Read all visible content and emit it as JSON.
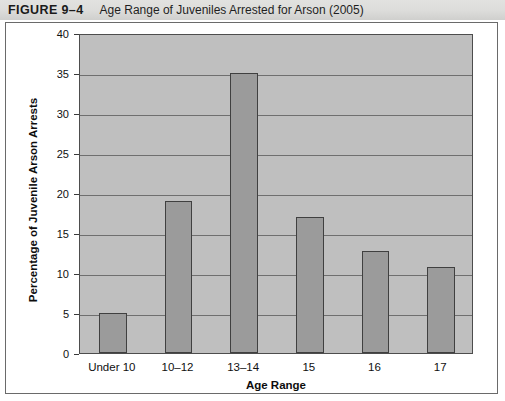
{
  "header": {
    "figure_label": "FIGURE 9–4",
    "figure_title": "Age Range of Juveniles Arrested for Arson (2005)"
  },
  "colors": {
    "header_band": "#dcdcda",
    "plot_background": "#bfbfbf",
    "bar_fill": "#9b9b9b",
    "bar_stroke": "#404040",
    "gridline": "#6f6f6f",
    "frame_border": "#6a6a6a"
  },
  "chart_data": {
    "type": "bar",
    "title": "Age Range of Juveniles Arrested for Arson (2005)",
    "xlabel": "Age Range",
    "ylabel": "Percentage of Juvenile Arson Arrests",
    "categories": [
      "Under 10",
      "10–12",
      "13–14",
      "15",
      "16",
      "17"
    ],
    "values": [
      5,
      19,
      35,
      17,
      12.8,
      10.7
    ],
    "ylim": [
      0,
      40
    ],
    "yticks": [
      0,
      5,
      10,
      15,
      20,
      25,
      30,
      35,
      40
    ],
    "ytick_labels": [
      "0",
      "5",
      "10",
      "15",
      "20",
      "25",
      "30",
      "35",
      "40"
    ],
    "grid": true,
    "legend": false,
    "legend_position": "none"
  }
}
